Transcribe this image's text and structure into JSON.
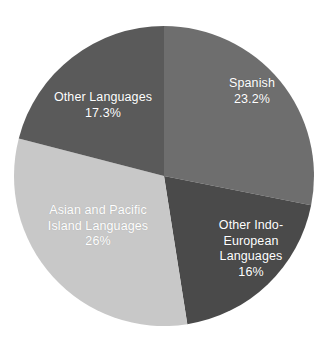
{
  "chart_data": {
    "type": "pie",
    "title": "",
    "subtitle": "",
    "xlabel": "",
    "ylabel": "",
    "legend_position": "none",
    "grid": false,
    "labels_inside_slices": true,
    "categories": [
      "Spanish",
      "Other Indo-European Languages",
      "Asian and Pacific Island Languages",
      "Other Languages"
    ],
    "values": [
      23.2,
      16,
      26,
      17.3
    ],
    "value_unit": "%",
    "slices": [
      {
        "name": "Spanish",
        "label": "Spanish",
        "value": 23.2,
        "value_text": "23.2%",
        "color": "#6e6e6e",
        "label_color": "#ffffff"
      },
      {
        "name": "Other Indo-European Languages",
        "label": "Other Indo-\nEuropean\nLanguages",
        "value": 16,
        "value_text": "16%",
        "color": "#4a4a4a",
        "label_color": "#ffffff"
      },
      {
        "name": "Asian and Pacific Island Languages",
        "label": "Asian and Pacific\nIsland Languages",
        "value": 26,
        "value_text": "26%",
        "color": "#c8c8c8",
        "label_color": "#ffffff"
      },
      {
        "name": "Other Languages",
        "label": "Other Languages",
        "value": 17.3,
        "value_text": "17.3%",
        "color": "#5a5a5a",
        "label_color": "#ffffff"
      }
    ],
    "background_color": "#ffffff",
    "start_angle_deg": 0,
    "direction": "clockwise",
    "center_x": 164,
    "center_y": 176,
    "radius": 150
  },
  "labels": {
    "spanish": "Spanish\n23.2%",
    "other_languages": "Other Languages\n17.3%",
    "asian_pacific": "Asian and Pacific\nIsland Languages\n26%",
    "other_indo_european": "Other Indo-\nEuropean\nLanguages\n16%"
  }
}
